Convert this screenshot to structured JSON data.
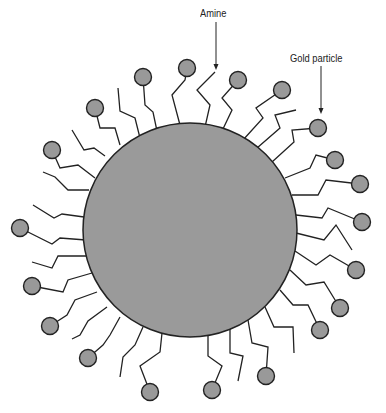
{
  "labels": {
    "amine": "Amine",
    "gold_particle": "Gold particle"
  },
  "colors": {
    "core": "#9a9a9a",
    "ball": "#999999",
    "stroke": "#222222"
  },
  "core": {
    "cx": 190,
    "cy": 230,
    "r": 107
  },
  "chains": [
    {
      "pts": [
        [
          180,
          125
        ],
        [
          172,
          95
        ],
        [
          185,
          80
        ],
        [
          187,
          68
        ]
      ],
      "ball": true
    },
    {
      "pts": [
        [
          205,
          127
        ],
        [
          210,
          105
        ],
        [
          197,
          90
        ],
        [
          215,
          72
        ]
      ],
      "ball": false
    },
    {
      "pts": [
        [
          222,
          131
        ],
        [
          232,
          110
        ],
        [
          222,
          98
        ],
        [
          238,
          80
        ]
      ],
      "ball": true
    },
    {
      "pts": [
        [
          243,
          140
        ],
        [
          263,
          118
        ],
        [
          256,
          108
        ],
        [
          282,
          90
        ]
      ],
      "ball": true
    },
    {
      "pts": [
        [
          257,
          148
        ],
        [
          280,
          128
        ],
        [
          275,
          115
        ],
        [
          296,
          110
        ]
      ],
      "ball": false
    },
    {
      "pts": [
        [
          272,
          162
        ],
        [
          294,
          142
        ],
        [
          292,
          130
        ],
        [
          318,
          128
        ]
      ],
      "ball": true
    },
    {
      "pts": [
        [
          285,
          178
        ],
        [
          310,
          168
        ],
        [
          316,
          155
        ],
        [
          335,
          160
        ]
      ],
      "ball": true
    },
    {
      "pts": [
        [
          292,
          195
        ],
        [
          318,
          195
        ],
        [
          326,
          180
        ],
        [
          360,
          184
        ]
      ],
      "ball": true
    },
    {
      "pts": [
        [
          296,
          215
        ],
        [
          322,
          218
        ],
        [
          328,
          208
        ],
        [
          362,
          222
        ]
      ],
      "ball": true
    },
    {
      "pts": [
        [
          296,
          233
        ],
        [
          324,
          240
        ],
        [
          336,
          225
        ],
        [
          352,
          250
        ]
      ],
      "ball": false
    },
    {
      "pts": [
        [
          295,
          251
        ],
        [
          316,
          265
        ],
        [
          330,
          255
        ],
        [
          356,
          270
        ]
      ],
      "ball": true
    },
    {
      "pts": [
        [
          290,
          270
        ],
        [
          306,
          285
        ],
        [
          324,
          282
        ],
        [
          340,
          308
        ]
      ],
      "ball": true
    },
    {
      "pts": [
        [
          280,
          290
        ],
        [
          293,
          305
        ],
        [
          308,
          305
        ],
        [
          320,
          330
        ]
      ],
      "ball": true
    },
    {
      "pts": [
        [
          265,
          307
        ],
        [
          274,
          327
        ],
        [
          293,
          327
        ],
        [
          294,
          353
        ]
      ],
      "ball": false
    },
    {
      "pts": [
        [
          248,
          320
        ],
        [
          252,
          343
        ],
        [
          268,
          347
        ],
        [
          266,
          376
        ]
      ],
      "ball": true
    },
    {
      "pts": [
        [
          230,
          328
        ],
        [
          230,
          353
        ],
        [
          243,
          356
        ],
        [
          238,
          381
        ]
      ],
      "ball": false
    },
    {
      "pts": [
        [
          208,
          334
        ],
        [
          208,
          356
        ],
        [
          222,
          366
        ],
        [
          212,
          390
        ]
      ],
      "ball": true
    },
    {
      "pts": [
        [
          162,
          333
        ],
        [
          160,
          352
        ],
        [
          140,
          366
        ],
        [
          150,
          392
        ]
      ],
      "ball": true
    },
    {
      "pts": [
        [
          143,
          327
        ],
        [
          135,
          345
        ],
        [
          123,
          357
        ],
        [
          120,
          377
        ]
      ],
      "ball": false
    },
    {
      "pts": [
        [
          120,
          317
        ],
        [
          110,
          335
        ],
        [
          103,
          345
        ],
        [
          88,
          358
        ]
      ],
      "ball": true
    },
    {
      "pts": [
        [
          107,
          307
        ],
        [
          88,
          321
        ],
        [
          80,
          335
        ],
        [
          72,
          339
        ]
      ],
      "ball": false
    },
    {
      "pts": [
        [
          97,
          292
        ],
        [
          75,
          300
        ],
        [
          67,
          315
        ],
        [
          50,
          326
        ]
      ],
      "ball": true
    },
    {
      "pts": [
        [
          92,
          273
        ],
        [
          68,
          280
        ],
        [
          63,
          292
        ],
        [
          32,
          286
        ]
      ],
      "ball": true
    },
    {
      "pts": [
        [
          87,
          256
        ],
        [
          58,
          256
        ],
        [
          52,
          268
        ],
        [
          32,
          262
        ]
      ],
      "ball": false
    },
    {
      "pts": [
        [
          86,
          240
        ],
        [
          60,
          238
        ],
        [
          52,
          244
        ],
        [
          20,
          228
        ]
      ],
      "ball": true
    },
    {
      "pts": [
        [
          84,
          217
        ],
        [
          62,
          214
        ],
        [
          54,
          218
        ],
        [
          33,
          205
        ]
      ],
      "ball": false
    },
    {
      "pts": [
        [
          89,
          190
        ],
        [
          68,
          190
        ],
        [
          55,
          177
        ],
        [
          43,
          172
        ]
      ],
      "ball": false
    },
    {
      "pts": [
        [
          95,
          178
        ],
        [
          78,
          165
        ],
        [
          60,
          168
        ],
        [
          52,
          150
        ]
      ],
      "ball": true
    },
    {
      "pts": [
        [
          105,
          156
        ],
        [
          94,
          148
        ],
        [
          84,
          150
        ],
        [
          72,
          130
        ]
      ],
      "ball": false
    },
    {
      "pts": [
        [
          120,
          145
        ],
        [
          115,
          128
        ],
        [
          100,
          128
        ],
        [
          95,
          108
        ]
      ],
      "ball": true
    },
    {
      "pts": [
        [
          140,
          138
        ],
        [
          135,
          118
        ],
        [
          120,
          111
        ],
        [
          118,
          88
        ]
      ],
      "ball": false
    },
    {
      "pts": [
        [
          157,
          131
        ],
        [
          153,
          112
        ],
        [
          145,
          105
        ],
        [
          143,
          77
        ]
      ],
      "ball": true
    }
  ],
  "arrows": [
    {
      "name": "amine",
      "x": 216,
      "y1": 22,
      "y2": 70
    },
    {
      "name": "gold",
      "x": 321,
      "y1": 66,
      "y2": 114
    }
  ]
}
